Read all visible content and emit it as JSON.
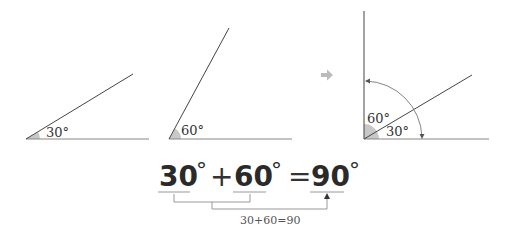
{
  "diagram": {
    "panel1": {
      "angle_label": "30°"
    },
    "panel2": {
      "angle_label": "60°"
    },
    "panel3": {
      "angle_label_upper": "60°",
      "angle_label_lower": "30°"
    },
    "arrow_glyph": "➡",
    "equation": {
      "term1": "30",
      "term2": "60",
      "result": "90",
      "degree": "°",
      "plus": "+",
      "equals": "=",
      "sum_note": "30+60=90"
    },
    "colors": {
      "line": "#444444",
      "baseline": "#888888",
      "wedge": "#c8c8c8",
      "arrow": "#bbbbbb",
      "bracket": "#999999",
      "text": "#2a2a2a"
    }
  }
}
